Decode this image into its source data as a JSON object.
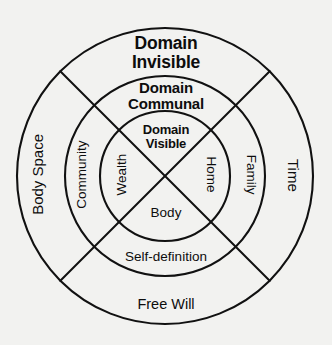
{
  "diagram": {
    "title": "Domain Invisible",
    "background_color": "#f2f2f0",
    "stroke_color": "#111111",
    "center": {
      "x": 165,
      "y": 176
    },
    "rings": [
      {
        "name": "inner",
        "radius": 65,
        "heading": "Domain\nVisible",
        "heading_line1": "Domain",
        "heading_line2": "Visible",
        "sectors": {
          "left": "Wealth",
          "right": "Home",
          "bottom": "Body"
        }
      },
      {
        "name": "middle",
        "radius": 100,
        "heading_line1": "Domain",
        "heading_line2": "Communal",
        "sectors": {
          "left": "Community",
          "right": "Family",
          "bottom": "Self-definition"
        }
      },
      {
        "name": "outer",
        "radius": 148,
        "heading_line1": "Domain",
        "heading_line2": "Invisible",
        "sectors": {
          "left": "Body Space",
          "right": "Time",
          "bottom": "Free Will"
        }
      }
    ],
    "labels": {
      "domain_invisible_line1": "Domain",
      "domain_invisible_line2": "Invisible",
      "domain_communal_line1": "Domain",
      "domain_communal_line2": "Communal",
      "domain_visible_line1": "Domain",
      "domain_visible_line2": "Visible",
      "wealth": "Wealth",
      "home": "Home",
      "body": "Body",
      "community": "Community",
      "family": "Family",
      "self_definition": "Self-definition",
      "body_space": "Body Space",
      "time": "Time",
      "free_will": "Free Will"
    }
  }
}
